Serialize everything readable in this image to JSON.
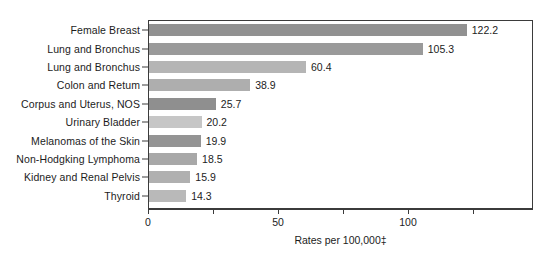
{
  "chart_data": {
    "type": "bar",
    "orientation": "horizontal",
    "title": "",
    "xlabel": "Rates per 100,000‡",
    "ylabel": "",
    "xlim": [
      0,
      148
    ],
    "xticks": [
      0,
      50,
      100
    ],
    "xtick_labels": [
      "0",
      "50",
      "100"
    ],
    "xminor_ticks": [
      25,
      75,
      125
    ],
    "grid": false,
    "legend": null,
    "categories": [
      "Female Breast",
      "Lung and Bronchus",
      "Lung and Bronchus",
      "Colon and Retum",
      "Corpus and Uterus, NOS",
      "Urinary Bladder",
      "Melanomas of the Skin",
      "Non-Hodgking Lymphoma",
      "Kidney and Renal Pelvis",
      "Thyroid"
    ],
    "values": [
      122.2,
      105.3,
      60.4,
      38.9,
      25.7,
      20.2,
      19.9,
      18.5,
      15.9,
      14.3
    ],
    "value_labels": [
      "122.2",
      "105.3",
      "60.4",
      "38.9",
      "25.7",
      "20.2",
      "19.9",
      "18.5",
      "15.9",
      "14.3"
    ],
    "bar_colors": [
      "#919191",
      "#9a9a9a",
      "#b5b5b5",
      "#aeaeae",
      "#8f8f8f",
      "#c6c6c6",
      "#949494",
      "#a8a8a8",
      "#b0b0b0",
      "#b9b9b9"
    ],
    "axis_color": "#3b3b3b",
    "background_color": "#ffffff",
    "text_color": "#1c1c1c"
  }
}
